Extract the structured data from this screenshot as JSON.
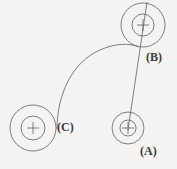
{
  "figure": {
    "background_color": "#f4f3f1",
    "stroke_color": "#6e6e6e",
    "label_color": "#3b3b3b",
    "width": 177,
    "height": 169
  },
  "nodes": [
    {
      "id": "A",
      "label": "(A)",
      "center_x": 128,
      "center_y": 128,
      "outer_radius": 16,
      "inner_radius": 8,
      "label_x": 140,
      "label_y": 145
    },
    {
      "id": "B",
      "label": "(B)",
      "center_x": 143,
      "center_y": 25,
      "outer_radius": 22,
      "inner_radius": 11,
      "label_x": 146,
      "label_y": 51
    },
    {
      "id": "C",
      "label": "(C)",
      "center_x": 33,
      "center_y": 128,
      "outer_radius": 23,
      "inner_radius": 12,
      "label_x": 57,
      "label_y": 121
    }
  ],
  "connectors": [
    {
      "id": "line-a-b",
      "type": "line",
      "from": "A",
      "to": "B",
      "x1": 128,
      "y1": 130,
      "x2": 147,
      "y2": 2
    },
    {
      "id": "curve-c-b",
      "type": "curve",
      "from": "C",
      "to": "B",
      "path": "M 57 129 C 57 95, 72 62, 100 50 C 115 43, 130 43, 139 47"
    }
  ],
  "cross_marker": {
    "arm_length": 6,
    "description": "small plus sign at each node centre"
  }
}
